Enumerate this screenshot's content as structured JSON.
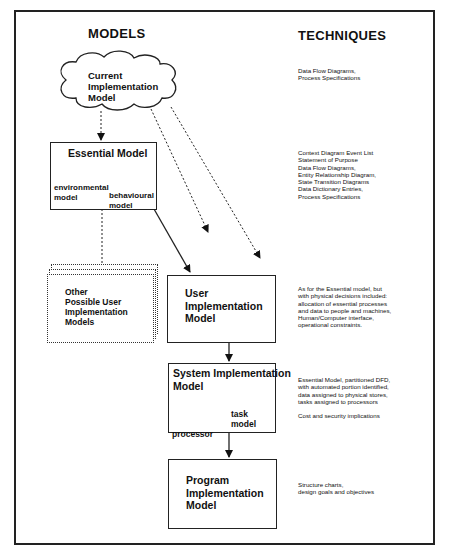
{
  "headings": {
    "models": "MODELS",
    "techniques": "TECHNIQUES"
  },
  "models": {
    "current": {
      "lines": [
        "Current",
        "Implementation",
        "Model"
      ]
    },
    "essential": {
      "title": "Essential Model",
      "children": [
        {
          "lines": [
            "environmental",
            "model"
          ]
        },
        {
          "lines": [
            "behavioural",
            "model"
          ]
        }
      ]
    },
    "other": {
      "lines": [
        "Other",
        "Possible User",
        "Implementation",
        "Models"
      ]
    },
    "user": {
      "lines": [
        "User",
        "Implementation",
        "Model"
      ]
    },
    "system": {
      "lines": [
        "System Implementation",
        "Model"
      ],
      "children": [
        {
          "lines": [
            "processor",
            " model"
          ]
        },
        {
          "lines": [
            "task",
            "model"
          ]
        }
      ]
    },
    "program": {
      "lines": [
        "Program",
        "Implementation",
        "Model"
      ]
    }
  },
  "techniques": {
    "current": [
      "Data Flow Diagrams,",
      "Process Specifications"
    ],
    "essential": [
      "Context Diagram Event List",
      "Statement of Purpose",
      "Data Flow Diagrams,",
      "Entity Relationship Diagram,",
      "State Transition Diagrams",
      "Data Dictionary Entries,",
      "Process Specifications"
    ],
    "user": [
      "As for the Essential model, but",
      "with physical decisions included:",
      "allocation of essential processes",
      "and data to people and machines,",
      "Human/Computer interface,",
      "operational constraints."
    ],
    "system": [
      "Essential Model, partitioned DFD,",
      "with automated portion identified,",
      "data assigned to physical stores,",
      "tasks assigned to processors"
    ],
    "system_extra": "Cost and security implications",
    "program": [
      "Structure charts,",
      "design goals and objectives"
    ]
  }
}
